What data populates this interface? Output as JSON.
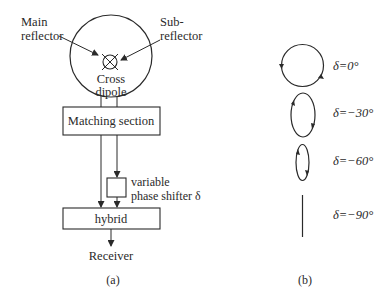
{
  "panel_a": {
    "main_reflector": {
      "line1": "Main",
      "line2": "reflector"
    },
    "sub_reflector": {
      "line1": "Sub-",
      "line2": "reflector"
    },
    "cross_dipole": {
      "line1": "Cross",
      "line2": "dipole"
    },
    "matching_section": "Matching section",
    "phase_shifter": {
      "line1": "variable",
      "line2": "phase shifter δ"
    },
    "hybrid": "hybrid",
    "receiver": "Receiver",
    "caption": "(a)"
  },
  "panel_b": {
    "polarizations": [
      {
        "label": "δ=0°",
        "shape": "circle"
      },
      {
        "label": "δ=−30°",
        "shape": "ellipse"
      },
      {
        "label": "δ=−60°",
        "shape": "narrow-ellipse"
      },
      {
        "label": "δ=−90°",
        "shape": "line"
      }
    ],
    "caption": "(b)"
  },
  "colors": {
    "stroke": "#2a2a2a",
    "background": "#ffffff"
  }
}
